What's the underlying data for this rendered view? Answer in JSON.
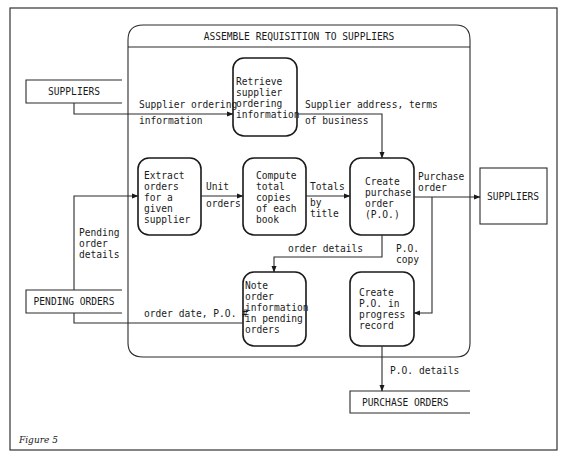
{
  "figure": {
    "caption": "Figure 5",
    "title": "ASSEMBLE REQUISITION TO SUPPLIERS"
  },
  "processes": [
    {
      "id": "retrieve",
      "lines": [
        "Retrieve",
        "supplier",
        "ordering",
        "information"
      ]
    },
    {
      "id": "extract",
      "lines": [
        "Extract",
        "orders",
        "for a",
        "given",
        "supplier"
      ]
    },
    {
      "id": "compute",
      "lines": [
        "Compute",
        "total",
        "copies",
        "of each",
        "book"
      ]
    },
    {
      "id": "create_po",
      "lines": [
        "Create",
        "purchase",
        "order",
        "(P.O.)"
      ]
    },
    {
      "id": "note",
      "lines": [
        "Note",
        "order",
        "information",
        "in pending",
        "orders"
      ]
    },
    {
      "id": "create_po_progress",
      "lines": [
        "Create",
        "P.O. in",
        "progress",
        "record"
      ]
    }
  ],
  "entities": {
    "suppliers_left": "SUPPLIERS",
    "suppliers_right": "SUPPLIERS",
    "pending_orders": "PENDING ORDERS",
    "purchase_orders": "PURCHASE ORDERS"
  },
  "flows": {
    "supplier_ordering_info": [
      "Supplier ordering",
      "information"
    ],
    "supplier_address_terms": [
      "Supplier address, terms",
      "of business"
    ],
    "unit_orders": [
      "Unit",
      "orders"
    ],
    "totals_by_title": [
      "Totals",
      "by",
      "title"
    ],
    "purchase_order": [
      "Purchase",
      "order"
    ],
    "pending_order_details": [
      "Pending",
      "order",
      "details"
    ],
    "order_details": [
      "order details"
    ],
    "po_copy": [
      "P.O.",
      "copy"
    ],
    "order_date_po": [
      "order date, P.O. #"
    ],
    "po_details": [
      "P.O. details"
    ]
  },
  "colors": {
    "ink": "#1a1a1a",
    "paper": "#ffffff"
  }
}
